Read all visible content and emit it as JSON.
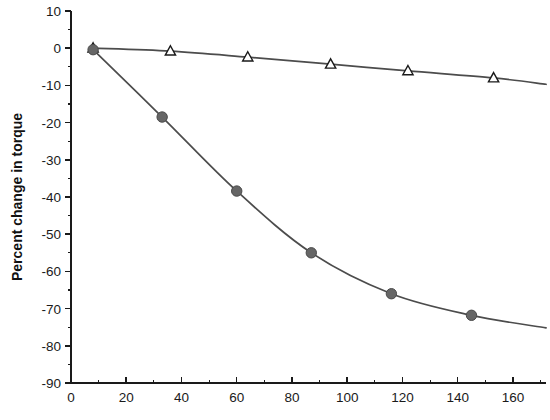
{
  "chart_data": {
    "type": "line",
    "title": "",
    "xlabel": "",
    "ylabel": "Percent change in torque",
    "xlim": [
      0,
      172
    ],
    "ylim": [
      -90,
      10
    ],
    "xticks": [
      0,
      20,
      40,
      60,
      80,
      100,
      120,
      140,
      160
    ],
    "yticks": [
      10,
      0,
      -10,
      -20,
      -30,
      -40,
      -50,
      -60,
      -70,
      -80,
      -90
    ],
    "xtick_labels": [
      "0",
      "20",
      "40",
      "60",
      "80",
      "100",
      "120",
      "140",
      "160"
    ],
    "ytick_labels": [
      "10",
      "0",
      "-10",
      "-20",
      "-30",
      "-40",
      "-50",
      "-60",
      "-70",
      "-80",
      "-90"
    ],
    "minor_ticks": true,
    "grid": false,
    "legend": null,
    "series": [
      {
        "name": "open-triangle-series",
        "marker": "triangle-open",
        "marker_color": "#ffffff",
        "line_color": "#4c4c4c",
        "points": [
          {
            "x": 8,
            "y": 0.0
          },
          {
            "x": 36,
            "y": -0.8
          },
          {
            "x": 64,
            "y": -2.4
          },
          {
            "x": 94,
            "y": -4.3
          },
          {
            "x": 122,
            "y": -6.1
          },
          {
            "x": 153,
            "y": -8.0
          },
          {
            "x": 172,
            "y": -9.7
          }
        ]
      },
      {
        "name": "filled-circle-series",
        "marker": "circle-filled",
        "marker_color": "#666666",
        "line_color": "#4c4c4c",
        "points": [
          {
            "x": 8,
            "y": -0.4
          },
          {
            "x": 33,
            "y": -18.5
          },
          {
            "x": 60,
            "y": -38.4
          },
          {
            "x": 87,
            "y": -55.0
          },
          {
            "x": 116,
            "y": -66.0
          },
          {
            "x": 145,
            "y": -71.8
          },
          {
            "x": 172,
            "y": -75.2
          }
        ]
      }
    ]
  },
  "axes": {
    "y_axis_title": "Percent change in torque"
  },
  "colors": {
    "axis": "#1a1a1a",
    "line": "#4c4c4c",
    "circle_fill": "#666666",
    "triangle_fill": "#ffffff",
    "background": "#ffffff"
  }
}
